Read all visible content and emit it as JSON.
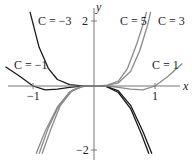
{
  "chart_data": {
    "type": "line",
    "title": "",
    "xlabel": "x",
    "ylabel": "y",
    "xlim": [
      -1.55,
      1.55
    ],
    "ylim": [
      -2.2,
      2.6
    ],
    "grid": false,
    "x_ticks": [
      {
        "value": -1,
        "label": "−1"
      },
      {
        "value": 1,
        "label": "1"
      }
    ],
    "y_ticks": [
      {
        "value": 2,
        "label": "2"
      },
      {
        "value": -2,
        "label": "−2"
      }
    ],
    "series": [
      {
        "name": "C = −3",
        "label": "C = −3",
        "color": "#1a1a1a",
        "points": [
          [
            -1.05,
            2.3
          ],
          [
            -0.9,
            1.2
          ],
          [
            -0.75,
            0.55
          ],
          [
            -0.6,
            0.2
          ],
          [
            -0.4,
            0.04
          ],
          [
            -0.2,
            0.003
          ],
          [
            0,
            0
          ],
          [
            0.2,
            -0.01
          ],
          [
            0.4,
            -0.15
          ],
          [
            0.6,
            -0.6
          ],
          [
            0.8,
            -1.4
          ],
          [
            0.95,
            -2.1
          ]
        ]
      },
      {
        "name": "C = −1",
        "label": "C = −1",
        "color": "#1a1a1a",
        "points": [
          [
            -1.45,
            0.6
          ],
          [
            -1.2,
            0.28
          ],
          [
            -1.0,
            0
          ],
          [
            -0.8,
            -0.12
          ],
          [
            -0.6,
            -0.1
          ],
          [
            -0.4,
            -0.04
          ],
          [
            -0.2,
            -0.005
          ],
          [
            0,
            0
          ],
          [
            0.2,
            -0.01
          ],
          [
            0.4,
            -0.2
          ],
          [
            0.6,
            -0.7
          ],
          [
            0.78,
            -1.5
          ],
          [
            0.9,
            -2.1
          ]
        ]
      },
      {
        "name": "C = 1",
        "label": "C = 1",
        "color": "#8a8a8a",
        "points": [
          [
            -0.9,
            -2.1
          ],
          [
            -0.75,
            -1.3
          ],
          [
            -0.6,
            -0.7
          ],
          [
            -0.4,
            -0.2
          ],
          [
            -0.2,
            -0.01
          ],
          [
            0,
            0
          ],
          [
            0.2,
            -0.005
          ],
          [
            0.4,
            -0.04
          ],
          [
            0.6,
            -0.1
          ],
          [
            0.8,
            -0.12
          ],
          [
            1.0,
            0
          ],
          [
            1.2,
            0.28
          ],
          [
            1.45,
            0.7
          ]
        ]
      },
      {
        "name": "C = 3",
        "label": "C = 3",
        "color": "#8a8a8a",
        "points": [
          [
            -0.85,
            -2.1
          ],
          [
            -0.7,
            -1.3
          ],
          [
            -0.55,
            -0.6
          ],
          [
            -0.35,
            -0.12
          ],
          [
            -0.15,
            -0.005
          ],
          [
            0,
            0
          ],
          [
            0.2,
            0.01
          ],
          [
            0.4,
            0.1
          ],
          [
            0.6,
            0.45
          ],
          [
            0.75,
            1.1
          ],
          [
            0.88,
            1.9
          ],
          [
            0.93,
            2.3
          ]
        ]
      },
      {
        "name": "C = 5",
        "label": "C = 5",
        "color": "#8a8a8a",
        "points": [
          [
            -0.95,
            -2.1
          ],
          [
            -0.8,
            -1.4
          ],
          [
            -0.6,
            -0.65
          ],
          [
            -0.4,
            -0.18
          ],
          [
            -0.2,
            -0.01
          ],
          [
            0,
            0
          ],
          [
            0.2,
            0.015
          ],
          [
            0.4,
            0.15
          ],
          [
            0.55,
            0.55
          ],
          [
            0.7,
            1.3
          ],
          [
            0.82,
            2.0
          ],
          [
            0.86,
            2.3
          ]
        ]
      }
    ],
    "annotations": [
      {
        "text": "C = −3",
        "x": -0.95,
        "y": 2.1
      },
      {
        "text": "C = −1",
        "x": -1.5,
        "y": 0.8
      },
      {
        "text": "C = 5",
        "x": 0.4,
        "y": 2.1
      },
      {
        "text": "C = 3",
        "x": 0.95,
        "y": 2.1
      },
      {
        "text": "C = 1",
        "x": 1.0,
        "y": 0.8
      }
    ]
  },
  "labels": {
    "x_axis": "x",
    "y_axis": "y",
    "tick_x_neg1": "−1",
    "tick_x_1": "1",
    "tick_y_2": "2",
    "tick_y_neg2": "−2",
    "curve_cm3": "C = −3",
    "curve_cm1": "C = −1",
    "curve_c5": "C = 5",
    "curve_c3": "C = 3",
    "curve_c1": "C = 1"
  }
}
